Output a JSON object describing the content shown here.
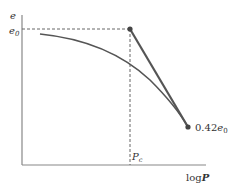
{
  "diagram": {
    "axes": {
      "y_label": "e",
      "x_label_prefix": "log",
      "x_label_var": "P"
    },
    "labels": {
      "e0_main": "e",
      "e0_sub": "0",
      "pc_main": "P",
      "pc_sub": "c",
      "end_coef": "0.42",
      "end_main": "e",
      "end_sub": "0"
    },
    "colors": {
      "axis": "#777777",
      "curve": "#555555",
      "line": "#555555",
      "dash": "#666666",
      "point": "#444444"
    }
  }
}
